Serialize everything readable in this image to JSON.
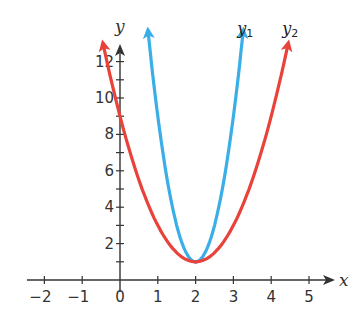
{
  "chart_data": {
    "type": "line",
    "title": "",
    "xlabel": "x",
    "ylabel": "y",
    "xlim": [
      -2.5,
      5.5
    ],
    "ylim": [
      0,
      13
    ],
    "x_ticks": [
      -2,
      -1,
      0,
      1,
      2,
      3,
      4,
      5
    ],
    "x_tick_labels": [
      "−2",
      "−1",
      "0",
      "1",
      "2",
      "3",
      "4",
      "5"
    ],
    "y_ticks": [
      1,
      2,
      3,
      4,
      5,
      6,
      7,
      8,
      9,
      10,
      11,
      12
    ],
    "y_tick_labels": [
      {
        "value": 2,
        "label": "2"
      },
      {
        "value": 4,
        "label": "4"
      },
      {
        "value": 6,
        "label": "6"
      },
      {
        "value": 8,
        "label": "8"
      },
      {
        "value": 10,
        "label": "10"
      },
      {
        "value": 12,
        "label": "12"
      }
    ],
    "grid": false,
    "series": [
      {
        "name": "y1",
        "label_main": "y",
        "label_sub": "1",
        "color": "#3aaee6",
        "formula": "8(x-2)^2 + 1",
        "a": 8,
        "h": 2,
        "k": 1,
        "x_range": [
          0.74,
          3.26
        ],
        "vertex": [
          2,
          1
        ]
      },
      {
        "name": "y2",
        "label_main": "y",
        "label_sub": "2",
        "color": "#e8423a",
        "formula": "2(x-2)^2 + 1",
        "a": 2,
        "h": 2,
        "k": 1,
        "x_range": [
          -0.45,
          4.45
        ],
        "vertex": [
          2,
          1
        ]
      }
    ]
  },
  "colors": {
    "axis": "#333333",
    "background": "#ffffff"
  }
}
